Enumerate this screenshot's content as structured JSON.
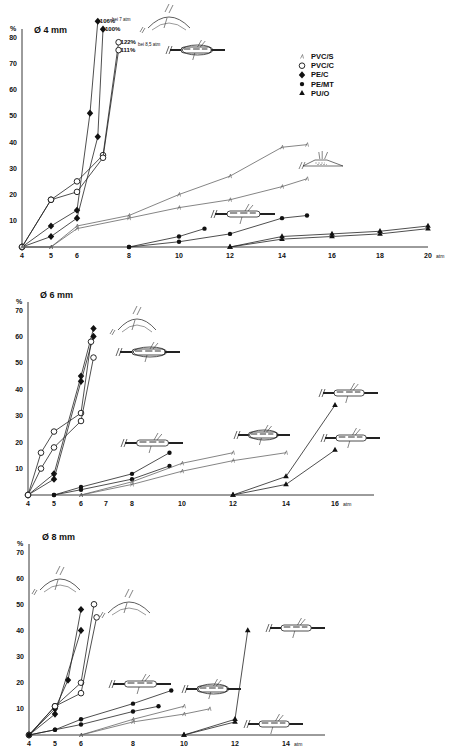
{
  "figure": {
    "y_unit": "%",
    "x_unit": "atm",
    "legend": [
      {
        "label": "PVC/S",
        "marker": "tick"
      },
      {
        "label": "PVC/C",
        "marker": "open-circle"
      },
      {
        "label": "PE/C",
        "marker": "filled-diamond"
      },
      {
        "label": "PE/MT",
        "marker": "filled-circle"
      },
      {
        "label": "PU/O",
        "marker": "filled-triangle"
      }
    ]
  },
  "chart_data": [
    {
      "type": "line",
      "title": "Ø 4 mm",
      "xlabel": "atm",
      "ylabel": "%",
      "xlim": [
        4,
        20
      ],
      "ylim": [
        0,
        80
      ],
      "xticks": [
        4,
        5,
        6,
        8,
        10,
        12,
        14,
        16,
        18,
        20
      ],
      "yticks": [
        10,
        20,
        30,
        40,
        50,
        60,
        70,
        80
      ],
      "grid": false,
      "legend_position": "upper right",
      "annotations": [
        "106%",
        "100%",
        "bei 7 atm",
        "122%",
        "bei 8,5 atm",
        "111%"
      ],
      "series": [
        {
          "name": "PE/C",
          "marker": "filled-diamond",
          "x": [
            4,
            5,
            6,
            6.5,
            6.8
          ],
          "y": [
            0,
            8,
            14,
            51,
            86
          ],
          "end_label": "106%"
        },
        {
          "name": "PE/C",
          "marker": "filled-diamond",
          "x": [
            4,
            5,
            6,
            6.8,
            7.0
          ],
          "y": [
            0,
            4,
            11,
            42,
            83
          ],
          "end_label": "100%"
        },
        {
          "name": "PVC/C",
          "marker": "open-circle",
          "x": [
            4,
            5,
            6,
            7.0,
            7.6
          ],
          "y": [
            0,
            18,
            25,
            35,
            78
          ],
          "end_label": "122%"
        },
        {
          "name": "PVC/C",
          "marker": "open-circle",
          "x": [
            4,
            5,
            6,
            7.0,
            7.6
          ],
          "y": [
            0,
            18,
            21,
            34,
            75
          ],
          "end_label": "111%"
        },
        {
          "name": "PVC/S",
          "marker": "tick",
          "x": [
            4,
            5,
            6,
            8,
            10,
            12,
            14,
            15
          ],
          "y": [
            0,
            0,
            8,
            12,
            20,
            27,
            38,
            39
          ]
        },
        {
          "name": "PVC/S",
          "marker": "tick",
          "x": [
            4,
            5,
            6,
            8,
            10,
            12,
            14,
            15
          ],
          "y": [
            0,
            0,
            7,
            11,
            15,
            18,
            23,
            26
          ]
        },
        {
          "name": "PE/MT",
          "marker": "filled-circle",
          "x": [
            8,
            10,
            11
          ],
          "y": [
            0,
            4,
            7
          ]
        },
        {
          "name": "PE/MT",
          "marker": "filled-circle",
          "x": [
            8,
            10,
            12,
            14,
            15
          ],
          "y": [
            0,
            2,
            5,
            11,
            12
          ]
        },
        {
          "name": "PU/O",
          "marker": "filled-triangle",
          "x": [
            12,
            14,
            16,
            18,
            20
          ],
          "y": [
            0,
            4,
            5,
            6,
            8
          ]
        },
        {
          "name": "PU/O",
          "marker": "filled-triangle",
          "x": [
            12,
            14,
            16,
            18,
            20
          ],
          "y": [
            0,
            3,
            4,
            5,
            7
          ]
        }
      ]
    },
    {
      "type": "line",
      "title": "Ø 6 mm",
      "xlabel": "atm",
      "ylabel": "%",
      "xlim": [
        4,
        16
      ],
      "ylim": [
        0,
        70
      ],
      "xticks": [
        4,
        5,
        6,
        7,
        8,
        10,
        12,
        14,
        16
      ],
      "yticks": [
        10,
        20,
        30,
        40,
        50,
        60,
        70
      ],
      "grid": false,
      "series": [
        {
          "name": "PE/C",
          "marker": "filled-diamond",
          "x": [
            4,
            5,
            6,
            6.5
          ],
          "y": [
            0,
            8,
            45,
            63
          ]
        },
        {
          "name": "PE/C",
          "marker": "filled-diamond",
          "x": [
            4,
            5,
            6,
            6.5
          ],
          "y": [
            0,
            6,
            43,
            60
          ]
        },
        {
          "name": "PVC/C",
          "marker": "open-circle",
          "x": [
            4,
            4.5,
            5,
            6,
            6.4
          ],
          "y": [
            0,
            16,
            24,
            31,
            58
          ]
        },
        {
          "name": "PVC/C",
          "marker": "open-circle",
          "x": [
            4,
            4.5,
            5,
            6,
            6.5
          ],
          "y": [
            0,
            10,
            18,
            28,
            52
          ]
        },
        {
          "name": "PE/MT",
          "marker": "filled-circle",
          "x": [
            5,
            6,
            8,
            9.5
          ],
          "y": [
            0,
            3,
            8,
            16
          ]
        },
        {
          "name": "PE/MT",
          "marker": "filled-circle",
          "x": [
            5,
            6,
            8,
            9.5
          ],
          "y": [
            0,
            2,
            6,
            11
          ]
        },
        {
          "name": "PVC/S",
          "marker": "tick",
          "x": [
            6,
            8,
            10,
            12
          ],
          "y": [
            0,
            5,
            12,
            16
          ]
        },
        {
          "name": "PVC/S",
          "marker": "tick",
          "x": [
            6,
            8,
            10,
            12,
            14
          ],
          "y": [
            0,
            4,
            9,
            13,
            16
          ]
        },
        {
          "name": "PU/O",
          "marker": "filled-triangle",
          "x": [
            12,
            14,
            16
          ],
          "y": [
            0,
            7,
            34
          ]
        },
        {
          "name": "PU/O",
          "marker": "filled-triangle",
          "x": [
            12,
            14,
            16
          ],
          "y": [
            0,
            4,
            17
          ]
        }
      ]
    },
    {
      "type": "line",
      "title": "Ø 8 mm",
      "xlabel": "atm",
      "ylabel": "%",
      "xlim": [
        4,
        14
      ],
      "ylim": [
        0,
        70
      ],
      "xticks": [
        4,
        5,
        6,
        8,
        10,
        12,
        14
      ],
      "yticks": [
        10,
        20,
        30,
        40,
        50,
        60,
        70
      ],
      "grid": false,
      "series": [
        {
          "name": "PE/C",
          "marker": "filled-diamond",
          "x": [
            4,
            5,
            5.5,
            6
          ],
          "y": [
            0,
            10,
            21,
            48
          ]
        },
        {
          "name": "PE/C",
          "marker": "filled-diamond",
          "x": [
            4,
            5,
            6
          ],
          "y": [
            0,
            8,
            40
          ]
        },
        {
          "name": "PVC/C",
          "marker": "open-circle",
          "x": [
            4,
            5,
            6,
            6.5
          ],
          "y": [
            0,
            11,
            20,
            50
          ]
        },
        {
          "name": "PVC/C",
          "marker": "open-circle",
          "x": [
            4,
            5,
            6,
            6.6
          ],
          "y": [
            0,
            11,
            16,
            45
          ]
        },
        {
          "name": "PE/MT",
          "marker": "filled-circle",
          "x": [
            4,
            5,
            6,
            8,
            9.5
          ],
          "y": [
            0,
            2,
            6,
            12,
            17
          ]
        },
        {
          "name": "PE/MT",
          "marker": "filled-circle",
          "x": [
            4,
            5,
            6,
            8,
            9
          ],
          "y": [
            0,
            2,
            4,
            9,
            11
          ]
        },
        {
          "name": "PVC/S",
          "marker": "tick",
          "x": [
            6,
            8,
            10
          ],
          "y": [
            0,
            6,
            11
          ]
        },
        {
          "name": "PVC/S",
          "marker": "tick",
          "x": [
            6,
            8,
            10,
            11
          ],
          "y": [
            0,
            5,
            8,
            10
          ]
        },
        {
          "name": "PU/O",
          "marker": "filled-triangle",
          "x": [
            10,
            12,
            12.5
          ],
          "y": [
            0,
            6,
            40
          ]
        },
        {
          "name": "PU/O",
          "marker": "filled-triangle",
          "x": [
            10,
            12
          ],
          "y": [
            0,
            5
          ]
        }
      ]
    }
  ]
}
